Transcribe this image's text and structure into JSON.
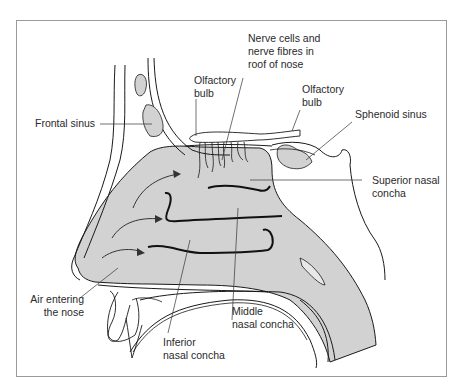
{
  "figure": {
    "colors": {
      "cavity_fill": "#d2d2d2",
      "sinus_fill": "#d2d2d2",
      "outline": "#1a1a1a",
      "leader": "#333333",
      "frame": "#9a9a9a"
    }
  },
  "labels": {
    "nerve_cells": [
      "Nerve cells and",
      "nerve fibres in",
      "roof of nose"
    ],
    "olfactory_bulb_left": [
      "Olfactory",
      "bulb"
    ],
    "olfactory_bulb_right": [
      "Olfactory",
      "bulb"
    ],
    "frontal_sinus": [
      "Frontal sinus"
    ],
    "sphenoid_sinus": [
      "Sphenoid sinus"
    ],
    "superior_concha": [
      "Superior nasal",
      "concha"
    ],
    "air_entering": [
      "Air entering",
      "the nose"
    ],
    "middle_concha": [
      "Middle",
      "nasal concha"
    ],
    "inferior_concha": [
      "Inferior",
      "nasal concha"
    ]
  }
}
